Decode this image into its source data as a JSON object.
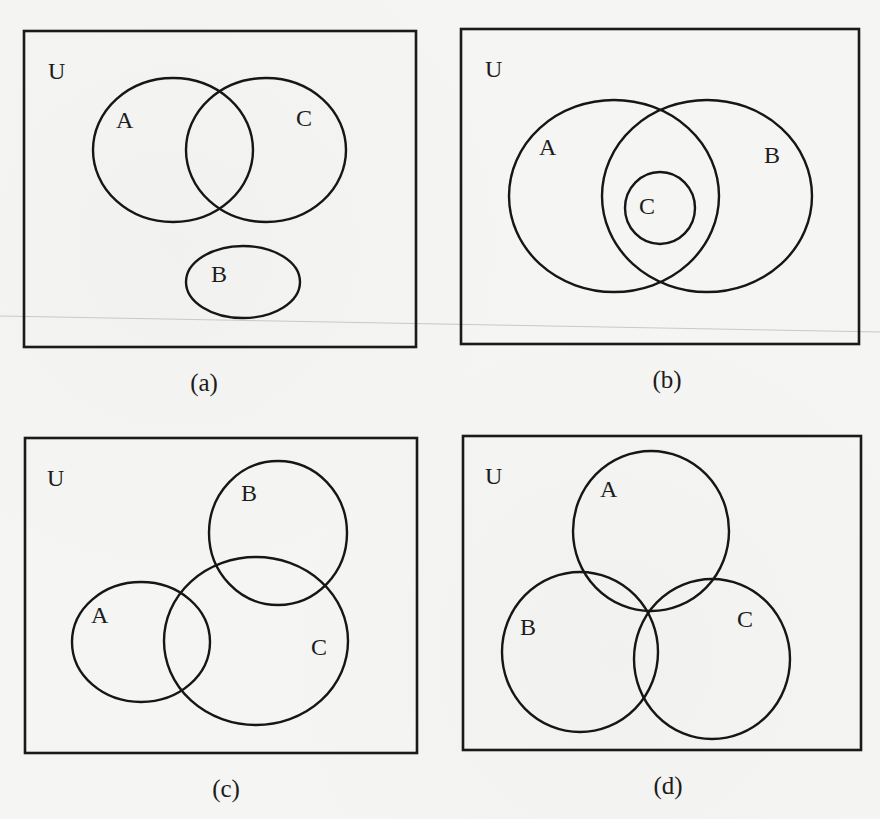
{
  "figure": {
    "panels": [
      {
        "id": "a",
        "caption": "(a)",
        "universe_label": "U",
        "description": "A and C overlap; B is disjoint from both",
        "frame": {
          "x": 24,
          "y": 31,
          "w": 392,
          "h": 316
        },
        "sets": [
          {
            "name": "A",
            "cx": 173,
            "cy": 150,
            "rx": 80,
            "ry": 72,
            "label_x": 127,
            "label_y": 127
          },
          {
            "name": "C",
            "cx": 266,
            "cy": 150,
            "rx": 80,
            "ry": 72,
            "label_x": 306,
            "label_y": 125
          },
          {
            "name": "B",
            "cx": 243,
            "cy": 282,
            "rx": 57,
            "ry": 36,
            "label_x": 221,
            "label_y": 281
          }
        ],
        "caption_x": 204,
        "caption_y": 391
      },
      {
        "id": "b",
        "caption": "(b)",
        "universe_label": "U",
        "description": "A and B overlap; C is a subset of A ∩ B",
        "frame": {
          "x": 461,
          "y": 29,
          "w": 398,
          "h": 315
        },
        "sets": [
          {
            "name": "A",
            "cx": 614,
            "cy": 196,
            "rx": 105,
            "ry": 96,
            "label_x": 549,
            "label_y": 154
          },
          {
            "name": "B",
            "cx": 707,
            "cy": 196,
            "rx": 105,
            "ry": 96,
            "label_x": 775,
            "label_y": 162
          },
          {
            "name": "C",
            "cx": 660,
            "cy": 208,
            "rx": 35,
            "ry": 36,
            "label_x": 649,
            "label_y": 213
          }
        ],
        "caption_x": 667,
        "caption_y": 388
      },
      {
        "id": "c",
        "caption": "(c)",
        "universe_label": "U",
        "description": "A overlaps C, B overlaps C; A and B are disjoint",
        "frame": {
          "x": 25,
          "y": 438,
          "w": 392,
          "h": 315
        },
        "sets": [
          {
            "name": "A",
            "cx": 141,
            "cy": 642,
            "rx": 69,
            "ry": 60,
            "label_x": 101,
            "label_y": 622
          },
          {
            "name": "B",
            "cx": 278,
            "cy": 533,
            "rx": 69,
            "ry": 72,
            "label_x": 251,
            "label_y": 500
          },
          {
            "name": "C",
            "cx": 256,
            "cy": 641,
            "rx": 92,
            "ry": 84,
            "label_x": 320,
            "label_y": 654
          }
        ],
        "caption_x": 226,
        "caption_y": 797
      },
      {
        "id": "d",
        "caption": "(d)",
        "universe_label": "U",
        "description": "A, B and C pairwise overlap, meeting at a single common point",
        "frame": {
          "x": 463,
          "y": 436,
          "w": 398,
          "h": 314
        },
        "sets": [
          {
            "name": "A",
            "cx": 651,
            "cy": 531,
            "rx": 78,
            "ry": 80,
            "label_x": 610,
            "label_y": 497
          },
          {
            "name": "B",
            "cx": 580,
            "cy": 652,
            "rx": 78,
            "ry": 80,
            "label_x": 530,
            "label_y": 634
          },
          {
            "name": "C",
            "cx": 712,
            "cy": 659,
            "rx": 78,
            "ry": 80,
            "label_x": 747,
            "label_y": 626
          }
        ],
        "caption_x": 668,
        "caption_y": 794
      }
    ]
  }
}
